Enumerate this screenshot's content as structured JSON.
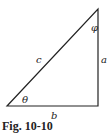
{
  "figure": {
    "caption": "Fig. 10-10",
    "shape": "right-triangle",
    "vertices": {
      "bottom_left": [
        7,
        106
      ],
      "bottom_right": [
        98,
        106
      ],
      "top_right": [
        98,
        9
      ]
    },
    "labels": {
      "hypotenuse": "c",
      "vertical_side": "a",
      "base": "b",
      "angle_bottom_left": "θ",
      "angle_top": "φ"
    },
    "line_color": "#222222"
  }
}
